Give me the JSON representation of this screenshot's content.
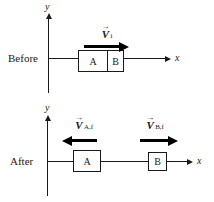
{
  "colors": {
    "ink": "#1a1a1a",
    "arrow-ink": "#000000",
    "background": "#ffffff"
  },
  "before": {
    "stage_label": "Before",
    "y_axis_label": "y",
    "x_axis_label": "x",
    "block_a_label": "A",
    "block_b_label": "B",
    "vector_i": {
      "accent": "→",
      "symbol": "V",
      "subscript": "i",
      "direction": "right"
    }
  },
  "after": {
    "stage_label": "After",
    "y_axis_label": "y",
    "x_axis_label": "x",
    "block_a_label": "A",
    "block_b_label": "B",
    "vector_a_f": {
      "accent": "→",
      "symbol": "V",
      "subscript": "A,f",
      "direction": "left"
    },
    "vector_b_f": {
      "accent": "→",
      "symbol": "V",
      "subscript": "B,f",
      "direction": "right"
    }
  }
}
